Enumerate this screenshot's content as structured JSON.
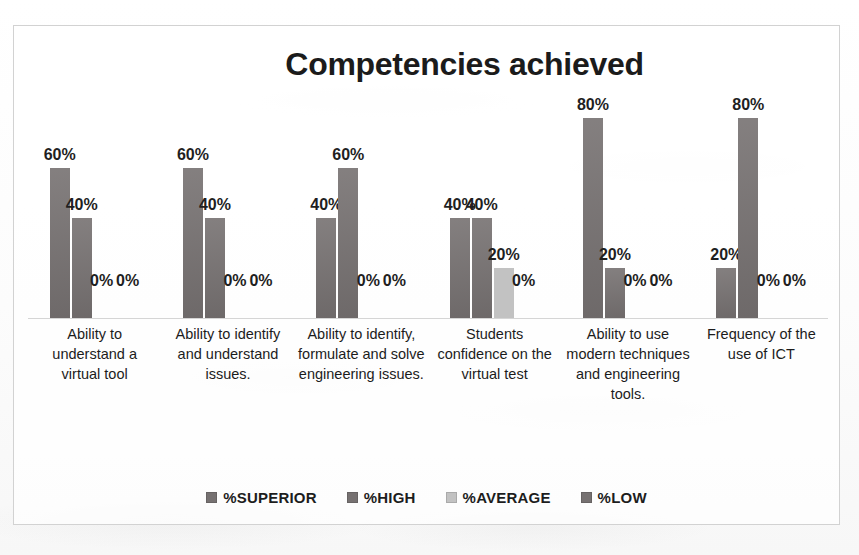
{
  "chart_data": {
    "type": "bar",
    "title": "Competencies achieved",
    "xlabel": "",
    "ylabel": "",
    "ylim": [
      0,
      100
    ],
    "grid": false,
    "legend_position": "bottom",
    "value_suffix": "%",
    "categories": [
      "Ability to understand a virtual tool",
      "Ability to identify and understand issues.",
      "Ability to identify, formulate and solve engineering issues.",
      "Students confidence on the virtual test",
      "Ability to use modern techniques and engineering tools.",
      "Frequency of the use of ICT"
    ],
    "series": [
      {
        "name": "%SUPERIOR",
        "color": "#767171",
        "values": [
          60,
          60,
          40,
          40,
          80,
          20
        ]
      },
      {
        "name": "%HIGH",
        "color": "#767171",
        "values": [
          40,
          40,
          60,
          40,
          20,
          80
        ]
      },
      {
        "name": "%AVERAGE",
        "color": "#c2c2c2",
        "values": [
          0,
          0,
          0,
          20,
          0,
          0
        ]
      },
      {
        "name": "%LOW",
        "color": "#767171",
        "values": [
          0,
          0,
          0,
          0,
          0,
          0
        ]
      }
    ],
    "data_labels": [
      [
        "60%",
        "40%",
        "0%",
        "0%"
      ],
      [
        "60%",
        "40%",
        "0%",
        "0%"
      ],
      [
        "40%",
        "60%",
        "0%",
        "0%"
      ],
      [
        "40%",
        "40%",
        "20%",
        "0%"
      ],
      [
        "80%",
        "20%",
        "0%",
        "0%"
      ],
      [
        "20%",
        "80%",
        "0%",
        "0%"
      ]
    ]
  },
  "legend": {
    "items": [
      {
        "label": "%SUPERIOR"
      },
      {
        "label": "%HIGH"
      },
      {
        "label": "%AVERAGE"
      },
      {
        "label": "%LOW"
      }
    ]
  }
}
